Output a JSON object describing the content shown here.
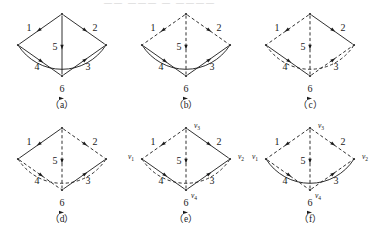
{
  "figure": {
    "bleed_text": "—— ——— — ————",
    "stroke_color": "#1a1a1a",
    "background": "#ffffff",
    "edge_labels": [
      "1",
      "2",
      "3",
      "4",
      "5",
      "6"
    ],
    "vertex_labels": {
      "v1": "v₁",
      "v2": "v₂",
      "v3": "v₃",
      "v4": "v₄"
    },
    "vertex_label_parts": {
      "v1": {
        "base": "v",
        "sub": "1"
      },
      "v2": {
        "base": "v",
        "sub": "2"
      },
      "v3": {
        "base": "v",
        "sub": "3"
      },
      "v4": {
        "base": "v",
        "sub": "4"
      }
    },
    "panels": [
      {
        "id": "a",
        "caption": "（a）",
        "show_vertex_labels": false,
        "edges": [
          {
            "label": "1",
            "from": "v3",
            "to": "v1",
            "style": "solid"
          },
          {
            "label": "2",
            "from": "v3",
            "to": "v2",
            "style": "solid"
          },
          {
            "label": "3",
            "from": "v4",
            "to": "v2",
            "style": "solid"
          },
          {
            "label": "4",
            "from": "v1",
            "to": "v4",
            "style": "solid"
          },
          {
            "label": "5",
            "from": "v3",
            "to": "v4",
            "style": "solid"
          },
          {
            "label": "6",
            "from": "v1",
            "to": "v2",
            "style": "solid",
            "shape": "arc"
          }
        ]
      },
      {
        "id": "b",
        "caption": "（b）",
        "show_vertex_labels": false,
        "edges": [
          {
            "label": "1",
            "from": "v3",
            "to": "v1",
            "style": "dashed"
          },
          {
            "label": "2",
            "from": "v3",
            "to": "v2",
            "style": "dashed"
          },
          {
            "label": "3",
            "from": "v4",
            "to": "v2",
            "style": "solid"
          },
          {
            "label": "4",
            "from": "v1",
            "to": "v4",
            "style": "solid"
          },
          {
            "label": "5",
            "from": "v3",
            "to": "v4",
            "style": "dashed"
          },
          {
            "label": "6",
            "from": "v1",
            "to": "v2",
            "style": "solid",
            "shape": "arc"
          }
        ]
      },
      {
        "id": "c",
        "caption": "（c）",
        "show_vertex_labels": false,
        "edges": [
          {
            "label": "1",
            "from": "v3",
            "to": "v1",
            "style": "dashed"
          },
          {
            "label": "2",
            "from": "v3",
            "to": "v2",
            "style": "solid"
          },
          {
            "label": "3",
            "from": "v4",
            "to": "v2",
            "style": "dashed"
          },
          {
            "label": "4",
            "from": "v1",
            "to": "v4",
            "style": "solid"
          },
          {
            "label": "5",
            "from": "v3",
            "to": "v4",
            "style": "dashed"
          },
          {
            "label": "6",
            "from": "v1",
            "to": "v2",
            "style": "dashed",
            "shape": "arc"
          }
        ]
      },
      {
        "id": "d",
        "caption": "（d）",
        "show_vertex_labels": false,
        "edges": [
          {
            "label": "1",
            "from": "v3",
            "to": "v1",
            "style": "solid"
          },
          {
            "label": "2",
            "from": "v3",
            "to": "v2",
            "style": "dashed"
          },
          {
            "label": "3",
            "from": "v4",
            "to": "v2",
            "style": "solid"
          },
          {
            "label": "4",
            "from": "v1",
            "to": "v4",
            "style": "dashed"
          },
          {
            "label": "5",
            "from": "v3",
            "to": "v4",
            "style": "dashed"
          },
          {
            "label": "6",
            "from": "v1",
            "to": "v2",
            "style": "dashed",
            "shape": "arc"
          }
        ]
      },
      {
        "id": "e",
        "caption": "（e）",
        "show_vertex_labels": true,
        "edges": [
          {
            "label": "1",
            "from": "v3",
            "to": "v1",
            "style": "dashed"
          },
          {
            "label": "2",
            "from": "v3",
            "to": "v2",
            "style": "solid"
          },
          {
            "label": "3",
            "from": "v4",
            "to": "v2",
            "style": "solid"
          },
          {
            "label": "4",
            "from": "v1",
            "to": "v4",
            "style": "solid"
          },
          {
            "label": "5",
            "from": "v3",
            "to": "v4",
            "style": "dashed"
          },
          {
            "label": "6",
            "from": "v1",
            "to": "v2",
            "style": "dashed",
            "shape": "arc"
          }
        ]
      },
      {
        "id": "f",
        "caption": "（f）",
        "show_vertex_labels": true,
        "edges": [
          {
            "label": "1",
            "from": "v3",
            "to": "v1",
            "style": "dashed"
          },
          {
            "label": "2",
            "from": "v3",
            "to": "v2",
            "style": "dashed"
          },
          {
            "label": "3",
            "from": "v4",
            "to": "v2",
            "style": "dashed"
          },
          {
            "label": "4",
            "from": "v1",
            "to": "v4",
            "style": "dashed"
          },
          {
            "label": "5",
            "from": "v3",
            "to": "v4",
            "style": "dashed"
          },
          {
            "label": "6",
            "from": "v1",
            "to": "v2",
            "style": "solid",
            "shape": "arc"
          }
        ]
      }
    ]
  }
}
